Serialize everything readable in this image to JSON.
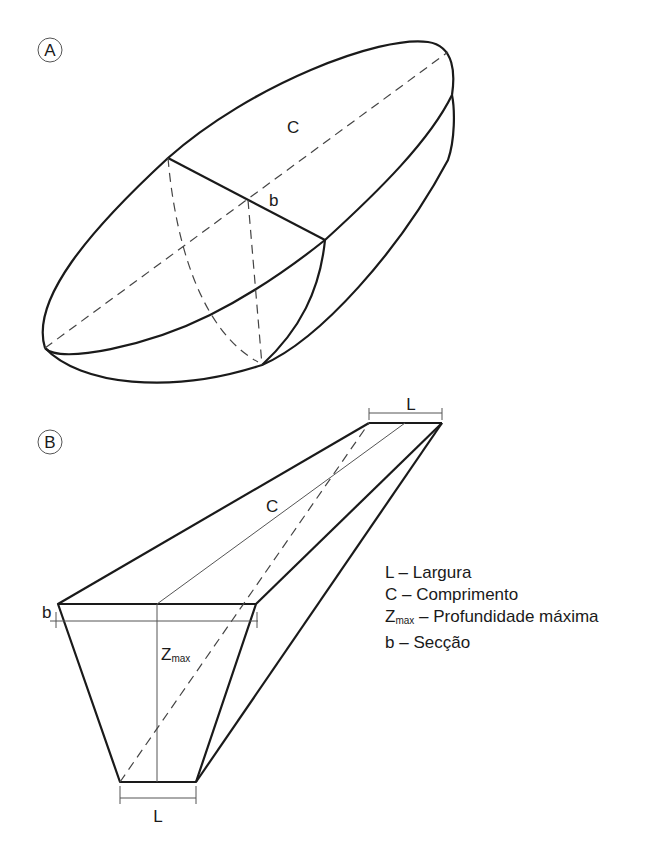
{
  "figure_a": {
    "marker": "A",
    "labels": {
      "length": "C",
      "section": "b"
    }
  },
  "figure_b": {
    "marker": "B",
    "labels": {
      "width_top": "L",
      "width_bottom": "L",
      "length": "C",
      "section": "b",
      "depth": "Z",
      "depth_sub": "max"
    }
  },
  "legend": {
    "items": [
      {
        "symbol": "L",
        "symbol_sub": "",
        "text": "– Largura"
      },
      {
        "symbol": "C",
        "symbol_sub": "",
        "text": "– Comprimento"
      },
      {
        "symbol": "Z",
        "symbol_sub": "max",
        "text": "– Profundidade máxima"
      },
      {
        "symbol": "b",
        "symbol_sub": "",
        "text": "– Secção"
      }
    ]
  },
  "colors": {
    "line": "#1a1a1a",
    "thin_line": "#555555"
  }
}
